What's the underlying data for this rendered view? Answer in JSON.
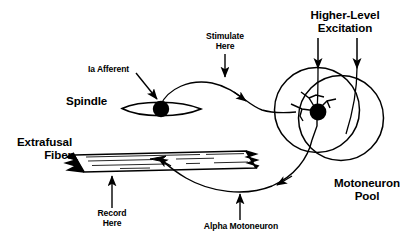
{
  "figure": {
    "background_color": "#ffffff",
    "stroke_color": "#000000"
  },
  "labels": {
    "higher_level_excitation": "Higher-Level\nExcitation",
    "stimulate_here": "Stimulate\nHere",
    "ia_afferent": "Ia Afferent",
    "spindle": "Spindle",
    "extrafusal_fiber": "Extrafusal\nFiber",
    "record_here": "Record\nHere",
    "alpha_motoneuron": "Alpha Motoneuron",
    "motoneuron_pool": "Motoneuron\nPool"
  },
  "parts": {
    "spindle_shape": "muscle-spindle-lens",
    "spindle_nucleus": "spindle-soma-dot",
    "motoneuron_pool_circle_primary": "pool-circle-outer",
    "motoneuron_pool_circle_secondary": "pool-circle-overlap",
    "motoneuron_soma": "motoneuron-soma-dot",
    "extrafusal_fiber_shape": "muscle-fiber-parallelogram"
  },
  "arrows": {
    "excitation_left": "arrow-down-into-pool-left",
    "excitation_right": "arrow-down-into-pool-right",
    "stimulate": "arrow-down-to-ia-afferent",
    "ia_afferent_pointer": "arrow-to-spindle",
    "ia_conduction": "arrow-along-ia-axon",
    "record_pointer": "arrow-up-to-fiber",
    "alpha_pointer": "arrow-up-to-axon",
    "motor_conduction": "arrow-along-motor-axon",
    "motor_terminal": "arrow-onto-fiber"
  }
}
